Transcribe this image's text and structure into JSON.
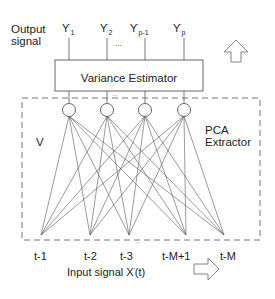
{
  "labels": {
    "output_signal_line1": "Output",
    "output_signal_line2": "signal",
    "variance_estimator": "Variance Estimator",
    "pca_line1": "PCA",
    "pca_line2": "Extractor",
    "weights": "V",
    "input_signal_prefix": "Input signal X",
    "input_signal_suffix": "(t)",
    "ellipsis": "..."
  },
  "outputs": [
    {
      "base": "Y",
      "sup": "'",
      "sub": "1"
    },
    {
      "base": "Y",
      "sup": "'",
      "sub": "2"
    },
    {
      "base": "Y",
      "sup": "'",
      "sub": "p-1"
    },
    {
      "base": "Y",
      "sup": "'",
      "sub": "p"
    }
  ],
  "inputs": [
    "t-1",
    "t-2",
    "t-3",
    "t-M+1",
    "t-M"
  ],
  "colors": {
    "line": "#555555",
    "text": "#222222"
  }
}
